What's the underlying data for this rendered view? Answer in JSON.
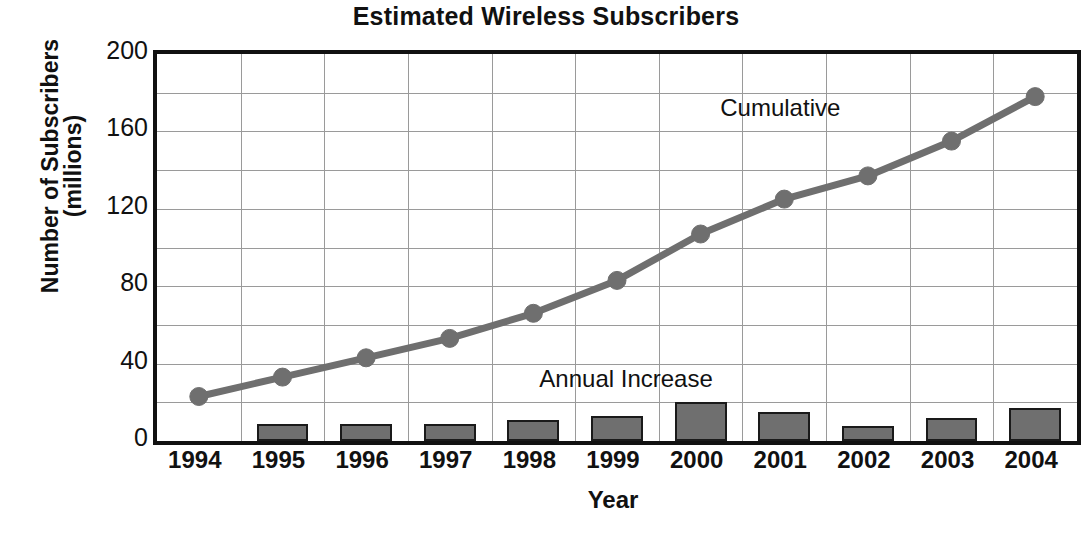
{
  "chart_data": {
    "type": "bar",
    "title": "Estimated Wireless Subscribers",
    "xlabel": "Year",
    "ylabel_lines": [
      "Number of Subscribers",
      "(millions)"
    ],
    "ylabel": "Number of Subscribers (millions)",
    "categories": [
      "1994",
      "1995",
      "1996",
      "1997",
      "1998",
      "1999",
      "2000",
      "2001",
      "2002",
      "2003",
      "2004"
    ],
    "ylim": [
      0,
      200
    ],
    "ytick_labels": [
      "0",
      "40",
      "80",
      "120",
      "160",
      "200"
    ],
    "ytick_values": [
      0,
      40,
      80,
      120,
      160,
      200
    ],
    "minor_gridline_values": [
      20,
      60,
      100,
      140,
      180
    ],
    "grid": true,
    "legend_position": "inline-annotations",
    "series": [
      {
        "name": "Annual Increase",
        "type": "bar",
        "color": "#6f6f6f",
        "values": [
          null,
          9,
          9,
          9,
          11,
          13,
          20,
          15,
          8,
          12,
          17
        ],
        "annotation": "Annual Increase"
      },
      {
        "name": "Cumulative",
        "type": "line",
        "color": "#6f6f6f",
        "values": [
          23,
          33,
          43,
          53,
          66,
          83,
          107,
          125,
          137,
          155,
          178
        ],
        "annotation": "Cumulative"
      }
    ],
    "annotations": [
      {
        "text": "Cumulative",
        "x_category": "2001",
        "y_value": 168
      },
      {
        "text": "Annual Increase",
        "x_category": "1998.6",
        "y_value": 30
      }
    ]
  }
}
